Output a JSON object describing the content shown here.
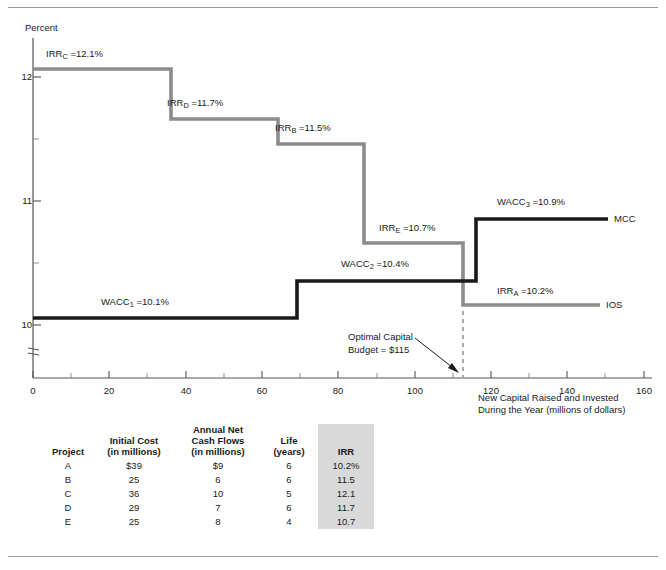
{
  "chart_data": {
    "type": "line",
    "subtype": "step",
    "title": "",
    "xlabel": "New Capital Raised and Invested During the Year (millions of dollars)",
    "ylabel": "Percent",
    "xlim": [
      0,
      160
    ],
    "ylim": [
      9.75,
      12.25
    ],
    "xticks": [
      0,
      20,
      40,
      60,
      80,
      100,
      120,
      140,
      160
    ],
    "xminorticks": [
      10,
      30,
      50,
      70,
      90,
      110,
      130,
      150
    ],
    "yticks": [
      10,
      11,
      12
    ],
    "yminorticks": [
      10.5,
      11.5
    ],
    "grid": false,
    "legend": "inline-right-labels",
    "axis_break_y": true,
    "series": [
      {
        "name": "IOS",
        "color": "#8c8c8c",
        "steps": [
          {
            "project": "C",
            "irr": 12.1,
            "x_start": 0,
            "x_end": 36,
            "label": "IRR_C =12.1%"
          },
          {
            "project": "D",
            "irr": 11.7,
            "x_start": 36,
            "x_end": 64,
            "label": "IRR_D =11.7%"
          },
          {
            "project": "B",
            "irr": 11.5,
            "x_start": 64,
            "x_end": 89,
            "label": "IRR_B =11.5%"
          },
          {
            "project": "E",
            "irr": 10.7,
            "x_start": 89,
            "x_end": 115,
            "label": "IRR_E =10.7%"
          },
          {
            "project": "A",
            "irr": 10.2,
            "x_start": 115,
            "x_end": 154,
            "label": "IRR_A =10.2%"
          }
        ]
      },
      {
        "name": "MCC",
        "color": "#1a1a1a",
        "steps": [
          {
            "wacc": 10.1,
            "x_start": 0,
            "x_end": 69,
            "label": "WACC_1 =10.1%"
          },
          {
            "wacc": 10.4,
            "x_start": 69,
            "x_end": 116,
            "label": "WACC_2 =10.4%"
          },
          {
            "wacc": 10.9,
            "x_start": 116,
            "x_end": 154,
            "label": "WACC_3 =10.9%"
          }
        ]
      }
    ],
    "annotations": [
      {
        "name": "optimal-capital-budget",
        "text_line1": "Optimal  Capital",
        "text_line2": "Budget = $115",
        "x": 115,
        "marker": "dashed-vline-with-arrow"
      }
    ]
  },
  "axes": {
    "y_title": "Percent",
    "y_tick_labels": [
      "12",
      "11",
      "10"
    ],
    "x_tick_labels": [
      "0",
      "20",
      "40",
      "60",
      "80",
      "100",
      "120",
      "140",
      "160"
    ],
    "x_caption_line1": "New Capital Raised and Invested",
    "x_caption_line2": "During the Year (millions of dollars)"
  },
  "labels": {
    "irr_c": {
      "base": "IRR",
      "sub": "C",
      "value": " =12.1%"
    },
    "irr_d": {
      "base": "IRR",
      "sub": "D",
      "value": " =11.7%"
    },
    "irr_b": {
      "base": "IRR",
      "sub": "B",
      "value": " =11.5%"
    },
    "irr_e": {
      "base": "IRR",
      "sub": "E",
      "value": " =10.7%"
    },
    "irr_a": {
      "base": "IRR",
      "sub": "A",
      "value": " =10.2%"
    },
    "wacc_1": {
      "base": "WACC",
      "sub": "1",
      "value": " =10.1%"
    },
    "wacc_2": {
      "base": "WACC",
      "sub": "2",
      "value": " =10.4%"
    },
    "wacc_3": {
      "base": "WACC",
      "sub": "3",
      "value": " =10.9%"
    },
    "series_mcc": "MCC",
    "series_ios": "IOS",
    "optimal_line1": "Optimal  Capital",
    "optimal_line2": "Budget = $115"
  },
  "table": {
    "headers": {
      "project": "Project",
      "initial_cost_l1": "Initial Cost",
      "initial_cost_l2": "(in millions)",
      "cash_flows_l1": "Annual Net",
      "cash_flows_l2": "Cash Flows",
      "cash_flows_l3": "(in millions)",
      "life_l1": "Life",
      "life_l2": "(years)",
      "irr": "IRR"
    },
    "rows": [
      {
        "project": "A",
        "initial_cost": "$39",
        "cash_flows": "$9",
        "life": "6",
        "irr": "10.2%"
      },
      {
        "project": "B",
        "initial_cost": "25",
        "cash_flows": "6",
        "life": "6",
        "irr": "11.5"
      },
      {
        "project": "C",
        "initial_cost": "36",
        "cash_flows": "10",
        "life": "5",
        "irr": "12.1"
      },
      {
        "project": "D",
        "initial_cost": "29",
        "cash_flows": "7",
        "life": "6",
        "irr": "11.7"
      },
      {
        "project": "E",
        "initial_cost": "25",
        "cash_flows": "8",
        "life": "4",
        "irr": "10.7"
      }
    ]
  },
  "colors": {
    "ios_line": "#8c8c8c",
    "mcc_line": "#1a1a1a",
    "axis": "#555555",
    "irr_column_shade": "#d9d9d9",
    "rule": "#9a9a9a"
  }
}
